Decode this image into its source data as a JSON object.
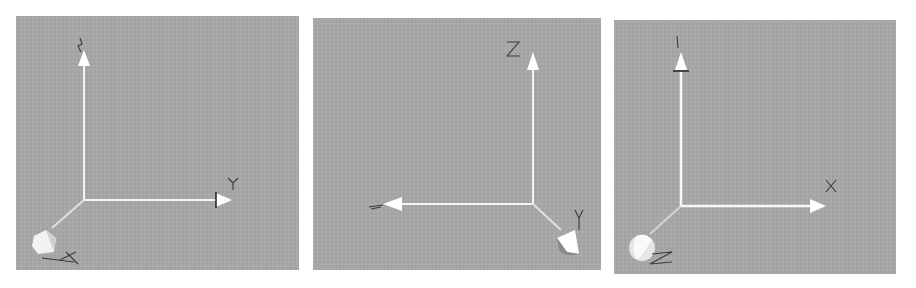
{
  "figure": {
    "background": "#ffffff",
    "panel_color": "#a8a8a8",
    "axis_color": "#ffffff",
    "label_color": "#3a3a3a",
    "panels": [
      {
        "id": "view-1",
        "box": [
          16,
          16,
          283,
          254
        ],
        "origin": [
          68,
          184
        ],
        "axes": [
          {
            "name": "Z",
            "label": "Z",
            "direction": "up",
            "label_visible_as": "edge-on"
          },
          {
            "name": "Y",
            "label": "Y",
            "direction": "right"
          },
          {
            "name": "X",
            "label": "X",
            "direction": "toward-viewer-lower-left"
          }
        ]
      },
      {
        "id": "view-2",
        "box": [
          313,
          18,
          288,
          252
        ],
        "origin": [
          220,
          186
        ],
        "axes": [
          {
            "name": "Z",
            "label": "Z",
            "direction": "up"
          },
          {
            "name": "X",
            "label": "X",
            "direction": "left",
            "label_visible_as": "edge-on"
          },
          {
            "name": "Y",
            "label": "Y",
            "direction": "toward-viewer-lower-right"
          }
        ]
      },
      {
        "id": "view-3",
        "box": [
          614,
          20,
          282,
          254
        ],
        "origin": [
          67,
          186
        ],
        "axes": [
          {
            "name": "Y",
            "label": "Y",
            "direction": "up",
            "label_visible_as": "edge-on"
          },
          {
            "name": "X",
            "label": "X",
            "direction": "right"
          },
          {
            "name": "Z",
            "label": "Z",
            "direction": "toward-viewer-lower-left"
          }
        ]
      }
    ]
  }
}
